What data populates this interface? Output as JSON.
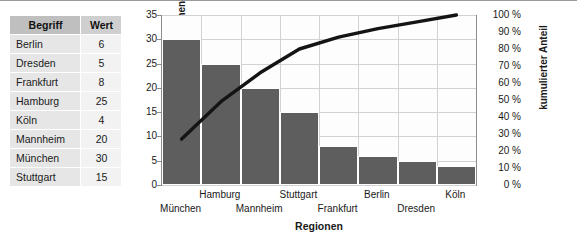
{
  "table": {
    "headers": [
      "Begriff",
      "Wert"
    ],
    "rows": [
      {
        "begriff": "Berlin",
        "wert": "6"
      },
      {
        "begriff": "Dresden",
        "wert": "5"
      },
      {
        "begriff": "Frankfurt",
        "wert": "8"
      },
      {
        "begriff": "Hamburg",
        "wert": "25"
      },
      {
        "begriff": "Köln",
        "wert": "4"
      },
      {
        "begriff": "Mannheim",
        "wert": "20"
      },
      {
        "begriff": "München",
        "wert": "30"
      },
      {
        "begriff": "Stuttgart",
        "wert": "15"
      }
    ]
  },
  "chart_data": {
    "type": "bar",
    "title": "",
    "subtitle": "",
    "xlabel": "Regionen",
    "ylabel": "Kundenreklamationen",
    "y2label": "kumulierter Anteil",
    "categories": [
      "München",
      "Hamburg",
      "Mannheim",
      "Stuttgart",
      "Frankfurt",
      "Berlin",
      "Dresden",
      "Köln"
    ],
    "values": [
      30,
      25,
      20,
      15,
      8,
      6,
      5,
      4
    ],
    "cumulative_percent": [
      27,
      49,
      66,
      80,
      87,
      92,
      96,
      100
    ],
    "ylim": [
      0,
      35
    ],
    "y2lim": [
      0,
      100
    ],
    "yticks": [
      "0",
      "5",
      "10",
      "15",
      "20",
      "25",
      "30",
      "35"
    ],
    "y2ticks": [
      "0 %",
      "10 %",
      "20 %",
      "30 %",
      "40 %",
      "50 %",
      "60 %",
      "70 %",
      "80 %",
      "90 %",
      "100 %"
    ],
    "grid": true,
    "legend": "none",
    "series": [
      {
        "name": "Kundenreklamationen",
        "type": "bar",
        "color": "#5e5e5e",
        "values": [
          30,
          25,
          20,
          15,
          8,
          6,
          5,
          4
        ]
      },
      {
        "name": "kumulierter Anteil",
        "type": "line",
        "color": "#141414",
        "values": [
          27,
          49,
          66,
          80,
          87,
          92,
          96,
          100
        ]
      }
    ],
    "colors": {
      "bar": "#5e5e5e",
      "line": "#141414",
      "grid": "#d2d2d2",
      "axis": "#8c8c8c"
    }
  }
}
